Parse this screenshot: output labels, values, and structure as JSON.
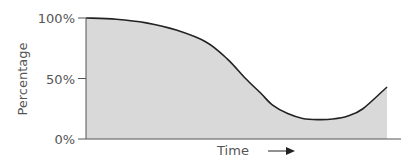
{
  "chart_data": {
    "type": "area",
    "title": "",
    "xlabel": "Time",
    "ylabel": "Percentage",
    "ylim": [
      0,
      100
    ],
    "xlim": [
      0,
      100
    ],
    "yticks": [
      {
        "value": 0,
        "label": "0%"
      },
      {
        "value": 50,
        "label": "50%"
      },
      {
        "value": 100,
        "label": "100%"
      }
    ],
    "grid": false,
    "legend": "none",
    "series": [
      {
        "name": "Percentage over time",
        "x": [
          0,
          10,
          20,
          30,
          40,
          47,
          53,
          58,
          62,
          67,
          72,
          77,
          82,
          87,
          92,
          100
        ],
        "y": [
          100,
          99,
          96,
          90,
          80,
          66,
          50,
          38,
          28,
          21,
          17,
          16,
          16.5,
          19,
          25,
          43
        ]
      }
    ],
    "colors": {
      "fill": "#d9d9d9",
      "line": "#222222",
      "axis": "#555555",
      "text": "#555555"
    }
  }
}
